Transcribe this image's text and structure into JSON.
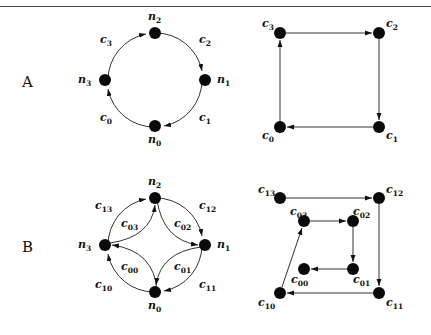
{
  "figure": {
    "rows": [
      {
        "label": "A",
        "circle_graph": {
          "nodes": [
            {
              "id": "n0",
              "base": "n",
              "sub": "0"
            },
            {
              "id": "n1",
              "base": "n",
              "sub": "1"
            },
            {
              "id": "n2",
              "base": "n",
              "sub": "2"
            },
            {
              "id": "n3",
              "base": "n",
              "sub": "3"
            }
          ],
          "edges": [
            {
              "label_base": "c",
              "label_sub": "0",
              "from": "n0",
              "to": "n3"
            },
            {
              "label_base": "c",
              "label_sub": "3",
              "from": "n3",
              "to": "n2"
            },
            {
              "label_base": "c",
              "label_sub": "2",
              "from": "n2",
              "to": "n1"
            },
            {
              "label_base": "c",
              "label_sub": "1",
              "from": "n1",
              "to": "n0"
            }
          ]
        },
        "square_graph": {
          "nodes": [
            {
              "id": "c3",
              "base": "c",
              "sub": "3"
            },
            {
              "id": "c2",
              "base": "c",
              "sub": "2"
            },
            {
              "id": "c1",
              "base": "c",
              "sub": "1"
            },
            {
              "id": "c0",
              "base": "c",
              "sub": "0"
            }
          ],
          "edges": [
            {
              "from": "c3",
              "to": "c2"
            },
            {
              "from": "c2",
              "to": "c1"
            },
            {
              "from": "c1",
              "to": "c0"
            },
            {
              "from": "c0",
              "to": "c3"
            }
          ]
        }
      },
      {
        "label": "B",
        "circle_graph": {
          "nodes": [
            {
              "id": "n0",
              "base": "n",
              "sub": "0"
            },
            {
              "id": "n1",
              "base": "n",
              "sub": "1"
            },
            {
              "id": "n2",
              "base": "n",
              "sub": "2"
            },
            {
              "id": "n3",
              "base": "n",
              "sub": "3"
            }
          ],
          "outer_edges": [
            {
              "label_base": "c",
              "label_sub": "10",
              "from": "n0",
              "to": "n3"
            },
            {
              "label_base": "c",
              "label_sub": "13",
              "from": "n3",
              "to": "n2"
            },
            {
              "label_base": "c",
              "label_sub": "12",
              "from": "n2",
              "to": "n1"
            },
            {
              "label_base": "c",
              "label_sub": "11",
              "from": "n1",
              "to": "n0"
            }
          ],
          "inner_edges": [
            {
              "label_base": "c",
              "label_sub": "00",
              "from": "n0",
              "to": "n3"
            },
            {
              "label_base": "c",
              "label_sub": "03",
              "from": "n3",
              "to": "n2"
            },
            {
              "label_base": "c",
              "label_sub": "02",
              "from": "n2",
              "to": "n1"
            },
            {
              "label_base": "c",
              "label_sub": "01",
              "from": "n1",
              "to": "n0"
            }
          ]
        },
        "square_graph": {
          "nodes": [
            {
              "id": "c13",
              "base": "c",
              "sub": "13"
            },
            {
              "id": "c12",
              "base": "c",
              "sub": "12"
            },
            {
              "id": "c11",
              "base": "c",
              "sub": "11"
            },
            {
              "id": "c10",
              "base": "c",
              "sub": "10"
            },
            {
              "id": "c03",
              "base": "c",
              "sub": "03"
            },
            {
              "id": "c02",
              "base": "c",
              "sub": "02"
            },
            {
              "id": "c01",
              "base": "c",
              "sub": "01"
            },
            {
              "id": "c00",
              "base": "c",
              "sub": "00"
            }
          ],
          "edges": [
            {
              "from": "c13",
              "to": "c12"
            },
            {
              "from": "c12",
              "to": "c11"
            },
            {
              "from": "c11",
              "to": "c10"
            },
            {
              "from": "c10",
              "to": "c03"
            },
            {
              "from": "c03",
              "to": "c02"
            },
            {
              "from": "c02",
              "to": "c01"
            },
            {
              "from": "c01",
              "to": "c00"
            }
          ]
        }
      }
    ]
  }
}
